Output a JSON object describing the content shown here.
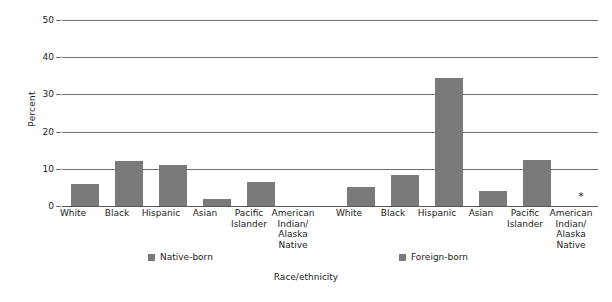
{
  "chart_data": {
    "type": "bar",
    "title": "",
    "xlabel": "Race/ethnicity",
    "ylabel": "Percent",
    "ylim": [
      0,
      50
    ],
    "yticks": [
      0,
      10,
      20,
      30,
      40,
      50
    ],
    "ytick_labels": [
      "0",
      "10",
      "20",
      "30",
      "40",
      "50"
    ],
    "grid": true,
    "legend_position": "bottom",
    "bar_color": "#7a7a7a",
    "groups": [
      {
        "name": "Native-born",
        "categories": [
          "White",
          "Black",
          "Hispanic",
          "Asian",
          "Pacific\nIslander",
          "American\nIndian/\nAlaska\nNative"
        ],
        "values": [
          6.0,
          12.0,
          11.0,
          2.0,
          6.5,
          15.4
        ]
      },
      {
        "name": "Foreign-born",
        "categories": [
          "White",
          "Black",
          "Hispanic",
          "Asian",
          "Pacific\nIslander",
          "American\nIndian/\nAlaska\nNative"
        ],
        "values": [
          5.0,
          8.3,
          34.3,
          4.0,
          12.5,
          null
        ]
      }
    ],
    "categories": [
      "White",
      "Black",
      "Hispanic",
      "Asian",
      "Pacific Islander",
      "American Indian/Alaska Native",
      "White",
      "Black",
      "Hispanic",
      "Asian",
      "Pacific Islander",
      "American Indian/Alaska Native"
    ],
    "series": [
      {
        "name": "Native-born",
        "values": [
          6.0,
          12.0,
          11.0,
          2.0,
          6.5,
          15.4,
          null,
          null,
          null,
          null,
          null,
          null
        ]
      },
      {
        "name": "Foreign-born",
        "values": [
          null,
          null,
          null,
          null,
          null,
          null,
          5.0,
          8.3,
          34.3,
          4.0,
          12.5,
          null
        ]
      }
    ],
    "annotations": [
      {
        "text": "*",
        "category": "American Indian/Alaska Native",
        "group": "Foreign-born",
        "meaning": "no data / value not reported"
      }
    ]
  },
  "axes": {
    "y_title": "Percent",
    "x_title": "Race/ethnicity",
    "y_tick_labels": [
      "50",
      "40",
      "30",
      "20",
      "10",
      "0"
    ]
  },
  "legend": {
    "native_label": "Native-born",
    "foreign_label": "Foreign-born"
  },
  "categories": {
    "white": "White",
    "black": "Black",
    "hispanic": "Hispanic",
    "asian": "Asian",
    "pacific_islander_line1": "Pacific",
    "pacific_islander_line2": "Islander",
    "american_indian_line1": "American",
    "american_indian_line2": "Indian/",
    "american_indian_line3": "Alaska",
    "american_indian_line4": "Native"
  },
  "markers": {
    "no_data": "*"
  }
}
